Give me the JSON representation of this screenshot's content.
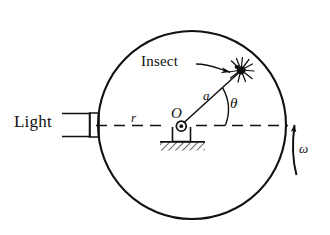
{
  "figure": {
    "type": "physics-diagram",
    "background_color": "#ffffff",
    "ink_color": "#101010"
  },
  "labels": {
    "light": "Light",
    "insect": "Insect",
    "radius": "r",
    "center": "O",
    "rod_length": "a",
    "angle": "θ",
    "angular_velocity": "ω"
  },
  "geometry": {
    "disc": {
      "center_x": 192,
      "center_y": 125,
      "radius": 94
    },
    "insect": {
      "x": 241,
      "y": 70
    },
    "light_box": {
      "x": 62,
      "y": 112,
      "width": 36,
      "height": 25
    },
    "pivot": {
      "x": 181,
      "y": 126
    },
    "angle_arc_radius": 44,
    "angle_degrees": 48
  },
  "elements": {
    "disc_outline": "circle",
    "center_axis": "horizontal-dashed-line",
    "rod": "line-from-center-to-insect",
    "ground": "hatched-support-base",
    "rotation_arrow": "curved-up-arrow",
    "leader_line": "curved-arrow-to-insect"
  }
}
